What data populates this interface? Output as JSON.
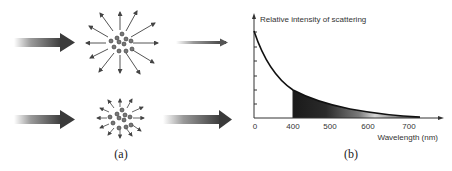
{
  "panel_a": {
    "caption": "(a)",
    "rows": [
      {
        "name": "strong-scattering",
        "description": "incoming beam, many scattered rays, weak transmitted beam"
      },
      {
        "name": "weak-scattering",
        "description": "incoming beam, few short scattered rays, strong transmitted beam"
      }
    ]
  },
  "panel_b": {
    "caption": "(b)",
    "ylabel": "Relative intensity of scattering",
    "xlabel": "Wavelength (nm)",
    "x_ticks": [
      "0",
      "400",
      "500",
      "600",
      "700"
    ]
  },
  "colors": {
    "ink": "#222222",
    "arrow_dark": "#3a3a3a",
    "arrow_light": "#ffffff"
  }
}
